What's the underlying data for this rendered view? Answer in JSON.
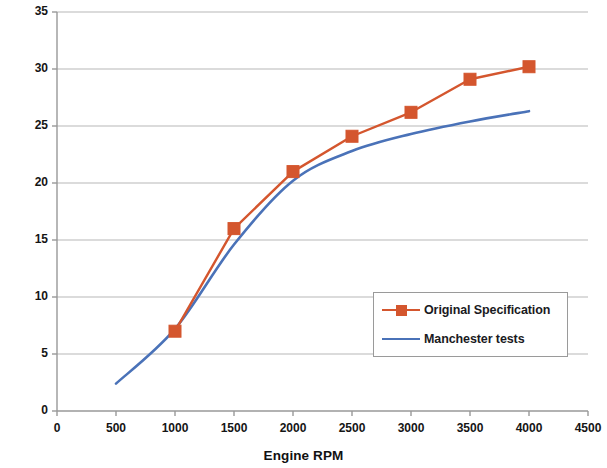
{
  "chart_data": {
    "type": "line",
    "title": "",
    "xlabel": "Engine RPM",
    "ylabel": "Degrees advance",
    "xlim": [
      0,
      4500
    ],
    "ylim": [
      0,
      35
    ],
    "xticks": [
      0,
      500,
      1000,
      1500,
      2000,
      2500,
      3000,
      3500,
      4000,
      4500
    ],
    "yticks": [
      0,
      5,
      10,
      15,
      20,
      25,
      30,
      35
    ],
    "grid": "horizontal",
    "legend_position": "lower-right-inside",
    "series": [
      {
        "name": "Original Specification",
        "color": "#D4562E",
        "marker": "square",
        "x": [
          1000,
          1500,
          2000,
          2500,
          3000,
          3500,
          4000
        ],
        "values": [
          7.0,
          16.0,
          21.0,
          24.1,
          26.2,
          29.1,
          30.2
        ]
      },
      {
        "name": "Manchester tests",
        "color": "#4A72B8",
        "marker": "none",
        "x": [
          500,
          1000,
          1500,
          2000,
          2500,
          3000,
          3500,
          4000
        ],
        "values": [
          2.4,
          7.2,
          14.6,
          20.2,
          22.8,
          24.3,
          25.4,
          26.3
        ]
      }
    ]
  },
  "axes": {
    "x_title": "Engine RPM",
    "y_title": "Degrees advance",
    "x_tick_labels": [
      "0",
      "500",
      "1000",
      "1500",
      "2000",
      "2500",
      "3000",
      "3500",
      "4000",
      "4500"
    ],
    "y_tick_labels": [
      "0",
      "5",
      "10",
      "15",
      "20",
      "25",
      "30",
      "35"
    ]
  },
  "legend": {
    "entries": [
      {
        "label": "Original Specification",
        "color": "#D4562E",
        "marker": "square"
      },
      {
        "label": "Manchester tests",
        "color": "#4A72B8",
        "marker": "none"
      }
    ]
  },
  "colors": {
    "series_original": "#D4562E",
    "series_manchester": "#4A72B8",
    "gridline": "#b7b7b7",
    "axis": "#999999",
    "text": "#111111",
    "background": "#ffffff"
  }
}
